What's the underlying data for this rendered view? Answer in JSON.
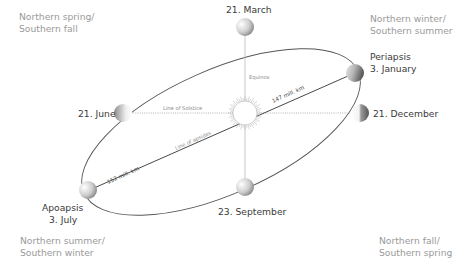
{
  "seasons": {
    "top_left": [
      "Northern spring/",
      "Southern fall"
    ],
    "top_right": [
      "Northern winter/",
      "Southern summer"
    ],
    "bottom_left": [
      "Northern summer/",
      "Southern winter"
    ],
    "bottom_right": [
      "Northern fall/",
      "Southern spring"
    ]
  },
  "positions": {
    "march": "21. March",
    "june": "21. June",
    "september": "23. September",
    "december": "21. December",
    "periapsis_title": "Periapsis",
    "periapsis_date": "3. January",
    "apoapsis_title": "Apoapsis",
    "apoapsis_date": "3. July"
  },
  "lines": {
    "equinox": "Equinox",
    "solstice": "Line of Solstice",
    "apsides": "Line of apsides",
    "perihelion_distance": "147 mill. km",
    "aphelion_distance": "152 mill. km"
  },
  "colors": {
    "orbit": "#555555",
    "sun_rays": "#bbbbbb",
    "text_season": "#9a9a9a",
    "text_date": "#3a3a3a"
  }
}
